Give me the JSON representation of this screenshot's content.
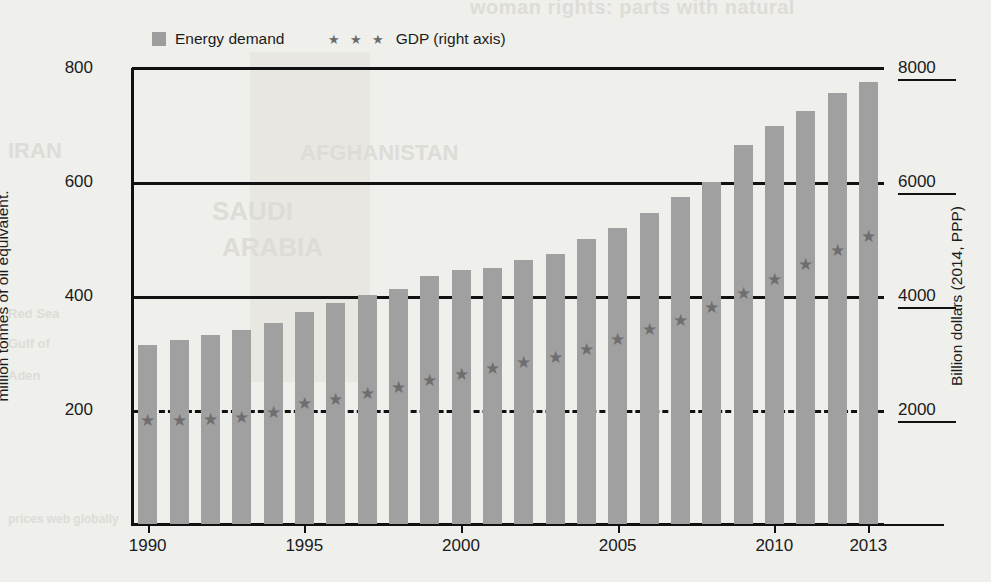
{
  "legend": {
    "items": [
      {
        "label": "Energy demand",
        "marker": "square-swatch",
        "color": "#a0a0a0"
      },
      {
        "label": "GDP (right axis)",
        "marker": "star-triple",
        "color": "#6e6e6e",
        "stars": "★ ★ ★"
      }
    ]
  },
  "axes": {
    "left_title": "million tonnes of oil equivalent.",
    "right_title": "Billion dollars (2014, PPP)",
    "left_ticks": [
      "200",
      "400",
      "600",
      "800"
    ],
    "right_ticks": [
      "2000",
      "4000",
      "6000",
      "8000"
    ],
    "x_ticks": [
      "1990",
      "1995",
      "2000",
      "2005",
      "2010",
      "2013"
    ]
  },
  "chart_data": {
    "type": "bar",
    "title": "",
    "xlabel": "",
    "ylabel": "million tonnes of oil equivalent.",
    "y2label": "Billion dollars (2014, PPP)",
    "ylim": [
      0,
      800
    ],
    "y2lim": [
      0,
      8000
    ],
    "grid": true,
    "legend_position": "top-left",
    "categories": [
      "1990",
      "1991",
      "1992",
      "1993",
      "1994",
      "1995",
      "1996",
      "1997",
      "1998",
      "1999",
      "2000",
      "2001",
      "2002",
      "2003",
      "2004",
      "2005",
      "2006",
      "2007",
      "2008",
      "2009",
      "2010",
      "2011",
      "2012",
      "2013"
    ],
    "series": [
      {
        "name": "Energy demand",
        "type": "bar",
        "axis": "left",
        "unit": "Mtoe",
        "color": "#a0a0a0",
        "values": [
          314,
          322,
          331,
          340,
          352,
          372,
          388,
          402,
          412,
          435,
          446,
          450,
          463,
          473,
          500,
          520,
          546,
          574,
          600,
          665,
          698,
          724,
          757,
          775
        ]
      },
      {
        "name": "GDP (right axis)",
        "type": "scatter",
        "axis": "right",
        "unit": "Billion dollars (2014, PPP)",
        "marker": "star",
        "color": "#6e6e6e",
        "values": [
          1820,
          1825,
          1840,
          1880,
          1970,
          2125,
          2200,
          2290,
          2400,
          2520,
          2640,
          2740,
          2840,
          2930,
          3070,
          3250,
          3420,
          3580,
          3800,
          4050,
          4300,
          4560,
          4810,
          5060
        ]
      }
    ]
  },
  "bleed_through": {
    "top": "woman rights: parts with natural",
    "a": "IRAN",
    "b": "AFGHANISTAN",
    "c": "SAUDI",
    "d": "ARABIA",
    "e": "Red Sea",
    "f": "Gulf of",
    "g": "Aden",
    "h": "prices web globally"
  }
}
